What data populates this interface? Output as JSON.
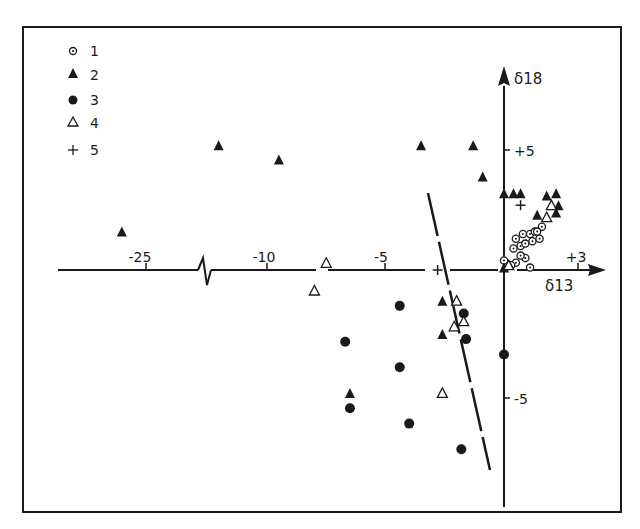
{
  "chart_data": {
    "type": "scatter",
    "title": "",
    "xlabel": "δ13",
    "ylabel": "δ18",
    "x_axis": {
      "ticks": [
        {
          "value": -25,
          "label": "-25"
        },
        {
          "value": -10,
          "label": "-10"
        },
        {
          "value": -5,
          "label": "-5"
        },
        {
          "value": 3,
          "label": "+3"
        }
      ],
      "broken_between": [
        -25,
        -10
      ]
    },
    "y_axis": {
      "ticks": [
        {
          "value": 5,
          "label": "+5"
        },
        {
          "value": -5,
          "label": "-5"
        }
      ]
    },
    "grid": false,
    "legend_position": "upper-left",
    "legend": [
      {
        "key": "1",
        "label": "1",
        "marker": "dotted-circle"
      },
      {
        "key": "2",
        "label": "2",
        "marker": "filled-triangle"
      },
      {
        "key": "3",
        "label": "3",
        "marker": "filled-circle"
      },
      {
        "key": "4",
        "label": "4",
        "marker": "open-triangle"
      },
      {
        "key": "5",
        "label": "5",
        "marker": "plus"
      }
    ],
    "annotations": [
      {
        "type": "dashed-line",
        "description": "long-dash dividing line from about (-3,4) to (-0.6,-8.3)"
      }
    ],
    "series": [
      {
        "name": "1",
        "marker": "dotted-circle",
        "points": [
          [
            0.0,
            0.4
          ],
          [
            0.4,
            0.9
          ],
          [
            0.5,
            1.3
          ],
          [
            0.7,
            1.0
          ],
          [
            0.8,
            1.5
          ],
          [
            0.9,
            1.1
          ],
          [
            1.1,
            1.5
          ],
          [
            1.2,
            1.2
          ],
          [
            1.3,
            1.6
          ],
          [
            1.5,
            1.3
          ],
          [
            1.6,
            1.8
          ],
          [
            0.5,
            0.3
          ],
          [
            0.9,
            0.5
          ],
          [
            1.1,
            0.1
          ],
          [
            0.3,
            0.2
          ],
          [
            1.4,
            1.6
          ],
          [
            0.7,
            0.6
          ]
        ]
      },
      {
        "name": "2",
        "marker": "filled-triangle",
        "points": [
          [
            -28.0,
            1.6
          ],
          [
            -16.0,
            5.2
          ],
          [
            -9.5,
            4.6
          ],
          [
            -3.5,
            5.2
          ],
          [
            -1.3,
            5.2
          ],
          [
            -0.9,
            3.9
          ],
          [
            0.0,
            3.2
          ],
          [
            0.4,
            3.2
          ],
          [
            0.7,
            3.2
          ],
          [
            1.8,
            3.1
          ],
          [
            2.2,
            3.2
          ],
          [
            1.4,
            2.3
          ],
          [
            2.2,
            2.4
          ],
          [
            2.3,
            2.7
          ],
          [
            0.0,
            0.1
          ],
          [
            -2.6,
            -1.2
          ],
          [
            -2.6,
            -2.5
          ],
          [
            -6.5,
            -4.8
          ]
        ]
      },
      {
        "name": "3",
        "marker": "filled-circle",
        "points": [
          [
            -4.4,
            -1.4
          ],
          [
            -6.7,
            -2.8
          ],
          [
            -4.4,
            -3.8
          ],
          [
            -6.5,
            -5.4
          ],
          [
            -4.0,
            -6.0
          ],
          [
            -1.6,
            -2.7
          ],
          [
            -1.7,
            -1.7
          ],
          [
            -1.8,
            -7.0
          ],
          [
            0.0,
            -3.3
          ]
        ]
      },
      {
        "name": "4",
        "marker": "open-triangle",
        "points": [
          [
            -7.5,
            0.3
          ],
          [
            -8.0,
            -0.8
          ],
          [
            -2.0,
            -1.2
          ],
          [
            -2.1,
            -2.2
          ],
          [
            -1.7,
            -2.0
          ],
          [
            -2.6,
            -4.8
          ],
          [
            2.0,
            2.7
          ],
          [
            1.8,
            2.2
          ],
          [
            0.2,
            0.2
          ]
        ]
      },
      {
        "name": "5",
        "marker": "plus",
        "points": [
          [
            -2.8,
            0.0
          ],
          [
            0.7,
            2.7
          ]
        ]
      }
    ]
  }
}
